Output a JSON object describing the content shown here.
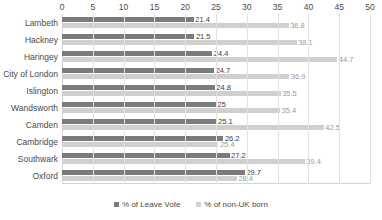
{
  "chart_data": {
    "type": "bar",
    "orientation": "horizontal",
    "title": "",
    "xlabel": "",
    "ylabel": "",
    "xlim": [
      0,
      50
    ],
    "xticks": [
      0,
      5,
      10,
      15,
      20,
      25,
      30,
      35,
      40,
      45,
      50
    ],
    "grid": true,
    "legend_position": "bottom",
    "categories": [
      "Lambeth",
      "Hackney",
      "Haringey",
      "City of London",
      "Islington",
      "Wandsworth",
      "Camden",
      "Cambridge",
      "Southwark",
      "Oxford"
    ],
    "series": [
      {
        "name": "% of Leave Vote",
        "color": "#7b7b7b",
        "values": [
          21.4,
          21.5,
          24.4,
          24.7,
          24.8,
          25,
          25.1,
          26.2,
          27.2,
          29.7
        ],
        "labels": [
          "21.4",
          "21.5",
          "24.4",
          "24.7",
          "24.8",
          "25",
          "25.1",
          "26.2",
          "27.2",
          "29.7"
        ]
      },
      {
        "name": "% of non-UK born",
        "color": "#cfcfcf",
        "values": [
          36.8,
          38.1,
          44.7,
          36.9,
          35.5,
          35.4,
          42.5,
          25.4,
          39.4,
          28.4
        ],
        "labels": [
          "36.8",
          "38.1",
          "44.7",
          "36.9",
          "35.5",
          "35.4",
          "42.5",
          "25.4",
          "39.4",
          "28.4"
        ]
      }
    ]
  },
  "legend": {
    "items": [
      {
        "label": "% of Leave Vote",
        "color": "#7b7b7b"
      },
      {
        "label": "% of non-UK born",
        "color": "#cfcfcf"
      }
    ]
  },
  "title_sliver": ""
}
